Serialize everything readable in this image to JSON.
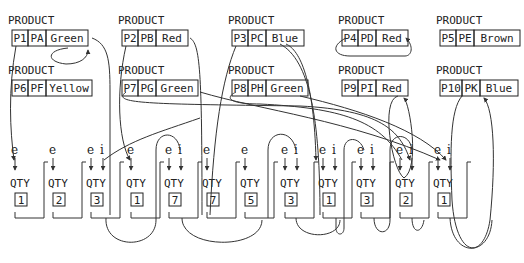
{
  "diagram": {
    "record_label": "PRODUCT",
    "qty_label": "QTY",
    "pointer_e": "e",
    "pointer_i": "i",
    "products": [
      {
        "id": "P1",
        "code": "PA",
        "color": "Green",
        "x": 12,
        "y": 30,
        "w2": 42
      },
      {
        "id": "P2",
        "code": "PB",
        "color": "Red",
        "x": 122,
        "y": 30,
        "w2": 32
      },
      {
        "id": "P3",
        "code": "PC",
        "color": "Blue",
        "x": 232,
        "y": 30,
        "w2": 38
      },
      {
        "id": "P4",
        "code": "PD",
        "color": "Red",
        "x": 342,
        "y": 30,
        "w2": 32
      },
      {
        "id": "P5",
        "code": "PE",
        "color": "Brown",
        "x": 440,
        "y": 30,
        "w2": 46
      },
      {
        "id": "P6",
        "code": "PF",
        "color": "Yellow",
        "x": 12,
        "y": 80,
        "w2": 46
      },
      {
        "id": "P7",
        "code": "PG",
        "color": "Green",
        "x": 122,
        "y": 80,
        "w2": 42
      },
      {
        "id": "P8",
        "code": "PH",
        "color": "Green",
        "x": 232,
        "y": 80,
        "w2": 42
      },
      {
        "id": "P9",
        "code": "PI",
        "color": "Red",
        "x": 342,
        "y": 80,
        "w2": 32
      },
      {
        "id": "P10",
        "code": "PK",
        "color": "Blue",
        "x": 440,
        "y": 80,
        "w2": 38
      }
    ],
    "qty_records": [
      {
        "value": "1",
        "x": 14,
        "has_i": false
      },
      {
        "value": "2",
        "x": 52,
        "has_i": false
      },
      {
        "value": "3",
        "x": 90,
        "has_i": true
      },
      {
        "value": "1",
        "x": 130,
        "has_i": false
      },
      {
        "value": "7",
        "x": 168,
        "has_i": true
      },
      {
        "value": "7",
        "x": 206,
        "has_i": false
      },
      {
        "value": "5",
        "x": 244,
        "has_i": false
      },
      {
        "value": "3",
        "x": 284,
        "has_i": true
      },
      {
        "value": "1",
        "x": 322,
        "has_i": true
      },
      {
        "value": "3",
        "x": 360,
        "has_i": true
      },
      {
        "value": "2",
        "x": 399,
        "has_i": true
      },
      {
        "value": "1",
        "x": 437,
        "has_i": true
      }
    ]
  }
}
